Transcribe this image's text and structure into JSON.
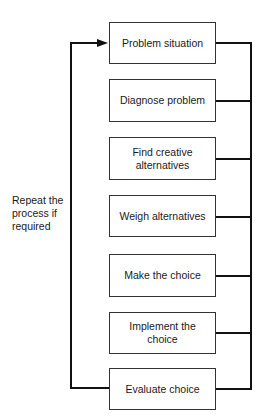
{
  "diagram": {
    "type": "flowchart",
    "steps": [
      {
        "label": "Problem situation"
      },
      {
        "label": "Diagnose problem"
      },
      {
        "label": "Find creative alternatives"
      },
      {
        "label": "Weigh alternatives"
      },
      {
        "label": "Make the choice"
      },
      {
        "label": "Implement the choice"
      },
      {
        "label": "Evaluate choice"
      }
    ],
    "feedback_label": "Repeat the process if required",
    "colors": {
      "line": "#111111",
      "box_border": "#333333",
      "background": "#ffffff"
    }
  }
}
